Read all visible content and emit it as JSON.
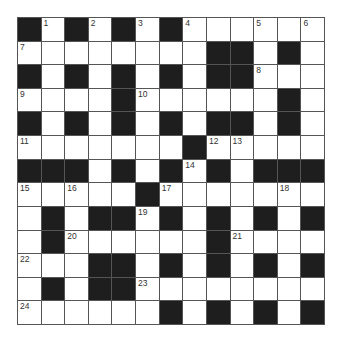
{
  "puzzle": {
    "rows": 13,
    "cols": 13,
    "colors": {
      "block": "#1e1e1e",
      "cell": "#ffffff",
      "line": "#555555"
    },
    "grid": [
      "#.#.#.#......",
      "........##.#.",
      "#.#.#.#.##...",
      "....#......#.",
      "#.#.#.#.##.#.",
      ".......#.....",
      "###.#.#.#.###",
      ".....#.......",
      ".#.##.#.#.#.#",
      ".#......#....",
      "...##.#.#.#.#",
      ".#.##........",
      "......#.#.#.#"
    ],
    "numbers": [
      {
        "r": 0,
        "c": 1,
        "n": "1"
      },
      {
        "r": 0,
        "c": 3,
        "n": "2"
      },
      {
        "r": 0,
        "c": 5,
        "n": "3"
      },
      {
        "r": 0,
        "c": 7,
        "n": "4"
      },
      {
        "r": 0,
        "c": 10,
        "n": "5"
      },
      {
        "r": 0,
        "c": 12,
        "n": "6"
      },
      {
        "r": 1,
        "c": 0,
        "n": "7"
      },
      {
        "r": 2,
        "c": 10,
        "n": "8"
      },
      {
        "r": 3,
        "c": 0,
        "n": "9"
      },
      {
        "r": 3,
        "c": 5,
        "n": "10"
      },
      {
        "r": 5,
        "c": 0,
        "n": "11"
      },
      {
        "r": 5,
        "c": 8,
        "n": "12"
      },
      {
        "r": 5,
        "c": 9,
        "n": "13"
      },
      {
        "r": 6,
        "c": 7,
        "n": "14"
      },
      {
        "r": 7,
        "c": 0,
        "n": "15"
      },
      {
        "r": 7,
        "c": 2,
        "n": "16"
      },
      {
        "r": 7,
        "c": 6,
        "n": "17"
      },
      {
        "r": 7,
        "c": 11,
        "n": "18"
      },
      {
        "r": 8,
        "c": 5,
        "n": "19"
      },
      {
        "r": 9,
        "c": 2,
        "n": "20"
      },
      {
        "r": 9,
        "c": 9,
        "n": "21"
      },
      {
        "r": 10,
        "c": 0,
        "n": "22"
      },
      {
        "r": 11,
        "c": 5,
        "n": "23"
      },
      {
        "r": 12,
        "c": 0,
        "n": "24"
      }
    ]
  }
}
